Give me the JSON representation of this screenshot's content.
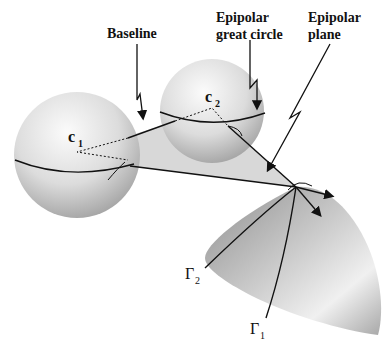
{
  "diagram": {
    "labels": {
      "baseline": "Baseline",
      "epipolar_great_circle_line1": "Epipolar",
      "epipolar_great_circle_line2": "great circle",
      "epipolar_plane_line1": "Epipolar",
      "epipolar_plane_line2": "plane",
      "c1": "c",
      "c1_sub": "1",
      "c2": "c",
      "c2_sub": "2",
      "gamma1": "Γ",
      "gamma1_sub": "1",
      "gamma2": "Γ",
      "gamma2_sub": "2"
    },
    "colors": {
      "background": "#ffffff",
      "sphere_light": "#f4f4f4",
      "sphere_dark": "#9a9a9a",
      "plane": "#d2d2d2",
      "surface_light": "#f2f2f2",
      "surface_dark": "#8c8c8c",
      "ink": "#111111"
    }
  }
}
